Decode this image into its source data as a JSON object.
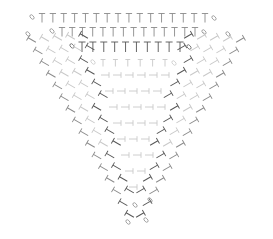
{
  "diagram": {
    "type": "crochet-stitch-chart",
    "shape": "inverted-triangle",
    "colors": {
      "dark": "#555555",
      "mid": "#8a8a8a",
      "light": "#c8c8c8"
    },
    "top_rows": [
      {
        "y": 18,
        "x_start": 42,
        "x_end": 205,
        "count": 16,
        "color": "mid",
        "size": 9
      },
      {
        "y": 32,
        "x_start": 62,
        "x_end": 195,
        "count": 14,
        "color": "mid",
        "size": 9
      },
      {
        "y": 47,
        "x_start": 82,
        "x_end": 180,
        "count": 10,
        "color": "dark",
        "size": 10
      },
      {
        "y": 63,
        "x_start": 103,
        "x_end": 165,
        "count": 6,
        "color": "light",
        "size": 7
      }
    ],
    "left_wedge": {
      "rows": 16,
      "apex": [
        135,
        218
      ],
      "top_left": [
        32,
        40
      ],
      "top_inner": [
        120,
        60
      ]
    },
    "right_wedge": {
      "rows": 16,
      "apex": [
        138,
        218
      ],
      "top_right": [
        240,
        40
      ],
      "top_inner": [
        150,
        60
      ]
    },
    "legend": []
  }
}
